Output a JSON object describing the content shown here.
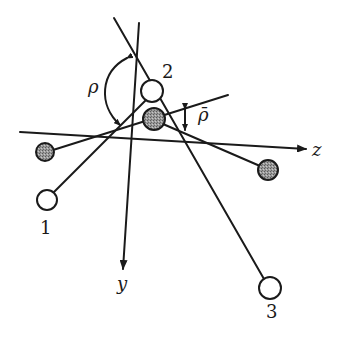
{
  "diagram": {
    "type": "molecular-geometry-schematic",
    "axes": {
      "z": {
        "label": "z",
        "from": [
          20,
          132
        ],
        "to": [
          307,
          149
        ]
      },
      "y": {
        "label": "y",
        "from": [
          139,
          23
        ],
        "to": [
          123,
          270
        ]
      }
    },
    "angles": {
      "rho": {
        "label": "ρ"
      },
      "rho_bar": {
        "label": "ρ̄"
      }
    },
    "open_atoms": [
      {
        "id": "1",
        "label": "1",
        "cx": 47,
        "cy": 200,
        "r": 10
      },
      {
        "id": "2",
        "label": "2",
        "cx": 152,
        "cy": 91,
        "r": 11
      },
      {
        "id": "3",
        "label": "3",
        "cx": 270,
        "cy": 288,
        "r": 11
      }
    ],
    "shaded_atoms": [
      {
        "id": "center",
        "cx": 154,
        "cy": 119,
        "r": 11
      },
      {
        "id": "left",
        "cx": 45,
        "cy": 152,
        "r": 9
      },
      {
        "id": "right",
        "cx": 268,
        "cy": 170,
        "r": 10
      }
    ],
    "colors": {
      "ink": "#1a1a1a",
      "shade": "#8a8a8a",
      "background": "#ffffff"
    }
  }
}
